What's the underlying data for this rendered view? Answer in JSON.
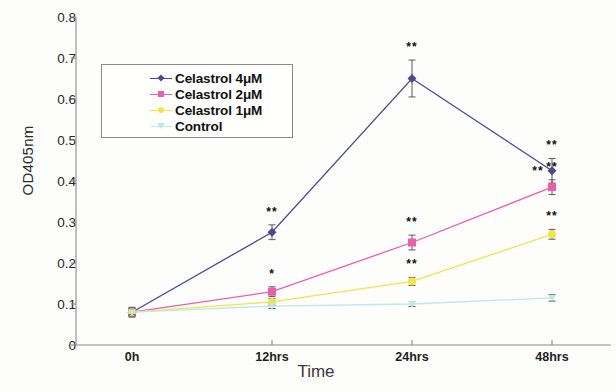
{
  "chart_data": {
    "type": "line",
    "title": "",
    "xlabel": "Time",
    "ylabel": "OD405nm",
    "categories": [
      "0h",
      "12hrs",
      "24hrs",
      "48hrs"
    ],
    "ylim": [
      0,
      0.8
    ],
    "yticks": [
      "0",
      "0.1",
      "0.2",
      "0.3",
      "0.4",
      "0.5",
      "0.6",
      "0.7",
      "0.8"
    ],
    "ytick_values": [
      0,
      0.1,
      0.2,
      0.3,
      0.4,
      0.5,
      0.6,
      0.7,
      0.8
    ],
    "grid": false,
    "legend_position": "upper-left-inside",
    "series": [
      {
        "name": "Celastrol 4μM",
        "color": "#4a4a8c",
        "marker": "diamond",
        "values": [
          0.08,
          0.275,
          0.65,
          0.425
        ],
        "errors": [
          0.012,
          0.018,
          0.045,
          0.03
        ],
        "annotations": [
          "",
          "**",
          "**",
          "**"
        ]
      },
      {
        "name": "Celastrol 2μM",
        "color": "#e85fae",
        "marker": "square",
        "values": [
          0.08,
          0.13,
          0.25,
          0.385
        ],
        "errors": [
          0.01,
          0.012,
          0.018,
          0.018
        ],
        "annotations": [
          "",
          "*",
          "**",
          "**"
        ]
      },
      {
        "name": "Celastrol 1μM",
        "color": "#f2e34a",
        "marker": "circle",
        "values": [
          0.08,
          0.105,
          0.155,
          0.27
        ],
        "errors": [
          0.008,
          0.008,
          0.01,
          0.012
        ],
        "annotations": [
          "",
          "",
          "**",
          "**"
        ]
      },
      {
        "name": "Control",
        "color": "#bfe8e6",
        "marker": "triangle",
        "values": [
          0.08,
          0.095,
          0.1,
          0.115
        ],
        "errors": [
          0.006,
          0.006,
          0.006,
          0.008
        ],
        "annotations": [
          "",
          "",
          "",
          ""
        ]
      }
    ]
  },
  "axis": {
    "y_label": "OD405nm",
    "x_label": "Time",
    "y_tick_labels": [
      "0.8",
      "0.7",
      "0.6",
      "0.5",
      "0.4",
      "0.3",
      "0.2",
      "0.1",
      "0"
    ],
    "x_tick_labels": [
      "0h",
      "12hrs",
      "24hrs",
      "48hrs"
    ]
  },
  "legend": {
    "items": [
      {
        "label": "Celastrol 4μM",
        "color": "#4a4a8c"
      },
      {
        "label": "Celastrol 2μM",
        "color": "#e85fae"
      },
      {
        "label": "Celastrol 1μM",
        "color": "#f2e34a"
      },
      {
        "label": "Control",
        "color": "#bfe8e6"
      }
    ]
  }
}
